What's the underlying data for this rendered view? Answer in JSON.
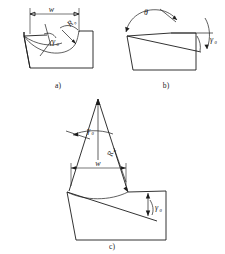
{
  "figure": {
    "title": "",
    "background_color": "#ffffff",
    "line_color": "#1c1c1c",
    "panels": [
      {
        "id": "a",
        "caption": "a)",
        "labels": {
          "width": "w",
          "radius": "R",
          "radius_sub": "n",
          "rake": "γ",
          "rake_sub": "0"
        }
      },
      {
        "id": "b",
        "caption": "b)",
        "labels": {
          "theta": "θ",
          "rake": "γ",
          "rake_sub": "0"
        }
      },
      {
        "id": "c",
        "caption": "c)",
        "labels": {
          "rake_top": "γ",
          "rake_top_sub": "0",
          "radius": "R",
          "radius_sub": "n",
          "width": "w",
          "rake_bottom": "γ",
          "rake_bottom_sub": "0"
        }
      }
    ]
  }
}
